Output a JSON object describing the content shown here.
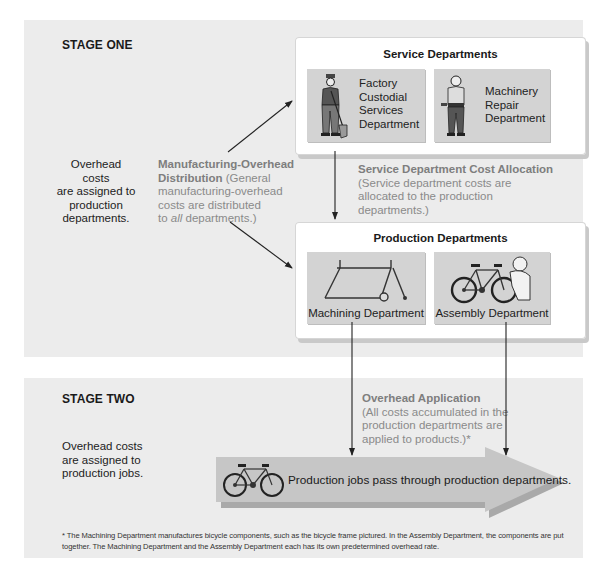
{
  "stage_one": {
    "title": "STAGE ONE",
    "note": "Overhead costs are assigned to production departments.",
    "note_lines": [
      "Overhead costs",
      "are assigned to",
      "production",
      "departments."
    ],
    "distribution": {
      "heading_line1": "Manufacturing-Overhead",
      "heading_line2": "Distribution",
      "text_line2_suffix": " (General",
      "text_line3": "manufacturing-overhead",
      "text_line4": "costs are distributed",
      "text_line5_pre": "to ",
      "text_line5_em": "all",
      "text_line5_post": " departments.)"
    },
    "service_departments": {
      "title": "Service Departments",
      "departments": [
        {
          "name": "Factory Custodial Services Department",
          "lines": [
            "Factory",
            "Custodial",
            "Services",
            "Department"
          ],
          "icon": "custodian-worker-icon"
        },
        {
          "name": "Machinery Repair Department",
          "lines": [
            "Machinery",
            "Repair",
            "Department"
          ],
          "icon": "repair-worker-icon"
        }
      ]
    },
    "allocation": {
      "heading": "Service Department Cost Allocation",
      "lines": [
        "(Service department costs are",
        "allocated to the production",
        "departments.)"
      ]
    },
    "production_departments": {
      "title": "Production Departments",
      "departments": [
        {
          "name": "Machining Department",
          "icon": "bicycle-frame-icon"
        },
        {
          "name": "Assembly Department",
          "icon": "bicycle-assembly-icon"
        }
      ]
    }
  },
  "stage_two": {
    "title": "STAGE TWO",
    "note_lines": [
      "Overhead costs",
      "are assigned to",
      "production jobs."
    ],
    "application": {
      "heading": "Overhead Application",
      "lines": [
        "(All costs accumulated in the",
        "production departments are",
        "applied to products.)*"
      ]
    },
    "flow_arrow_label": "Production jobs pass through production departments.",
    "flow_icon": "bicycle-icon"
  },
  "footnote": {
    "line1": "* The Machining Department manufactures bicycle components, such as the bicycle frame pictured. In the Assembly Department, the components are put",
    "line2": "together. The Machining Department and the Assembly Department each has its own predetermined overhead rate."
  },
  "colors": {
    "panel_bg": "#ececec",
    "dept_box_bg": "#d3d3d3",
    "label_grey": "#8a8a8a",
    "arrow_fill": "#c4c4c4"
  }
}
